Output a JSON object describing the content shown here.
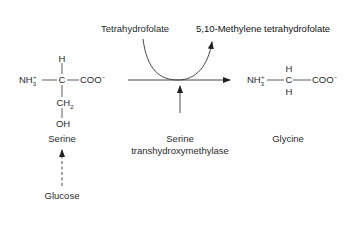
{
  "diagram": {
    "type": "biochemical-reaction",
    "cofactor_in": "Tetrahydrofolate",
    "cofactor_out": "5,10-Methylene tetrahydrofolate",
    "substrate": {
      "name": "Serine",
      "amine": "NH",
      "amine_sub": "3",
      "amine_sup": "+",
      "alpha_carbon": "C",
      "top_group": "H",
      "carboxyl": "COO",
      "carboxyl_sup": "−",
      "side_chain_1": "CH",
      "side_chain_1_sub": "2",
      "side_chain_2": "OH"
    },
    "product": {
      "name": "Glycine",
      "amine": "NH",
      "amine_sub": "3",
      "amine_sup": "+",
      "alpha_carbon": "C",
      "top_group": "H",
      "bottom_group": "H",
      "carboxyl": "COO",
      "carboxyl_sup": "−"
    },
    "enzyme": {
      "line1": "Serine",
      "line2": "transhydroxymethylase"
    },
    "precursor": "Glucose",
    "colors": {
      "lines": "#333333",
      "text": "#2a2a2a",
      "background": "#ffffff"
    }
  }
}
